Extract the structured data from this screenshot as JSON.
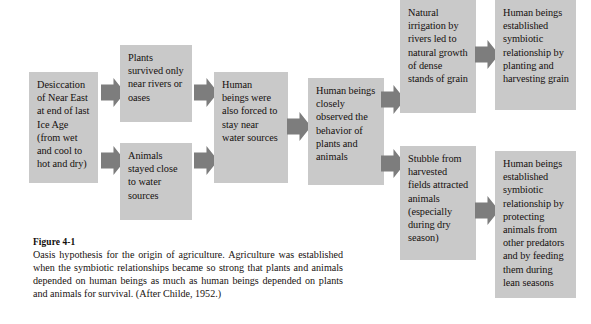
{
  "figure": {
    "number_label": "Figure 4-1",
    "caption": "Oasis hypothesis for the origin of agriculture. Agriculture was established when the symbiotic relationships became so strong that plants and animals depended on human beings as much as human beings depended on plants and animals for survival. (After Childe, 1952.)"
  },
  "colors": {
    "box_fill": "#c9c9c9",
    "arrow_fill": "#7d7d7d",
    "background": "#ffffff",
    "text": "#15100e"
  },
  "flowchart": {
    "type": "flowchart",
    "direction": "left-to-right",
    "nodes": [
      {
        "id": "n1",
        "text": "Desiccation of Near East at end of last Ice Age (from wet and cool to hot and dry)"
      },
      {
        "id": "n2",
        "text": "Plants survived only near rivers or oases"
      },
      {
        "id": "n3",
        "text": "Animals stayed close to water sources"
      },
      {
        "id": "n4",
        "text": "Human beings were also forced to stay near water sources"
      },
      {
        "id": "n5",
        "text": "Human beings closely observed the behavior of plants and animals"
      },
      {
        "id": "n6",
        "text": "Natural irrigation by rivers led to natural growth of dense stands of grain"
      },
      {
        "id": "n7",
        "text": "Stubble from harvested fields attracted animals (especially during dry season)"
      },
      {
        "id": "n8",
        "text": "Human beings established symbiotic relationship by planting and harvesting grain"
      },
      {
        "id": "n9",
        "text": "Human beings established symbiotic relationship by protecting animals from other predators and by feeding them during lean seasons"
      }
    ],
    "edges": [
      {
        "from": "n1",
        "to": "n2"
      },
      {
        "from": "n1",
        "to": "n3"
      },
      {
        "from": "n2",
        "to": "n4"
      },
      {
        "from": "n3",
        "to": "n4"
      },
      {
        "from": "n4",
        "to": "n5"
      },
      {
        "from": "n5",
        "to": "n6"
      },
      {
        "from": "n5",
        "to": "n7"
      },
      {
        "from": "n6",
        "to": "n8"
      },
      {
        "from": "n7",
        "to": "n9"
      }
    ]
  }
}
